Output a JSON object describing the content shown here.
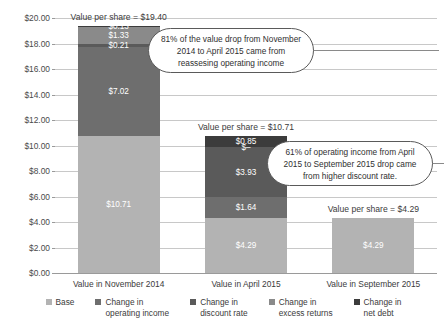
{
  "chart_data": {
    "type": "bar",
    "subtype": "stacked-bar",
    "title": "",
    "xlabel": "",
    "ylabel": "",
    "ylim": [
      0,
      20
    ],
    "ytick_step": 2,
    "grid": true,
    "legend_position": "bottom",
    "currency_prefix": "$",
    "ytick_labels": [
      "$0.00",
      "$2.00",
      "$4.00",
      "$6.00",
      "$8.00",
      "$10.00",
      "$12.00",
      "$14.00",
      "$16.00",
      "$18.00",
      "$20.00"
    ],
    "categories": [
      "Value in November 2014",
      "Value in April 2015",
      "Value in September 2015"
    ],
    "series": [
      {
        "name": "Base",
        "color": "#b3b3b3",
        "values": [
          10.71,
          4.29,
          4.29
        ],
        "labels": [
          "$10.71",
          "$4.29",
          "$4.29"
        ]
      },
      {
        "name": "Change in operating income",
        "color": "#6e6e6e",
        "values": [
          7.02,
          1.64,
          0
        ],
        "labels": [
          "$7.02",
          "$1.64",
          ""
        ]
      },
      {
        "name": "Change in discount rate",
        "color": "#5a5a5a",
        "values": [
          0.21,
          3.93,
          0
        ],
        "labels": [
          "$0.21",
          "$3.93",
          ""
        ]
      },
      {
        "name": "Change in excess returns",
        "color": "#8a8a8a",
        "values": [
          1.33,
          0.0,
          0
        ],
        "labels": [
          "$1.33",
          "$–",
          ""
        ]
      },
      {
        "name": "Change in net debt",
        "color": "#3c3c3c",
        "values": [
          0.13,
          0.85,
          0
        ],
        "labels": [
          "$0.13",
          "$0.85",
          ""
        ]
      }
    ],
    "totals": [
      19.4,
      10.71,
      4.29
    ],
    "total_labels": [
      "Value per share = $19.40",
      "Value per share = $10.71",
      "Value per share = $4.29"
    ],
    "annotations": [
      {
        "id": "callout-operating-income",
        "text": "81% of the value drop from November 2014 to April 2015 came from reassesing operating income"
      },
      {
        "id": "callout-discount-rate",
        "text": "61% of operating income from April 2015 to September 2015 drop came from higher discount rate."
      }
    ]
  },
  "legend": {
    "items": [
      {
        "label": "Base"
      },
      {
        "label": "Change in\noperating income"
      },
      {
        "label": "Change in\ndiscount rate"
      },
      {
        "label": "Change in\nexcess returns"
      },
      {
        "label": "Change in\nnet debt"
      }
    ]
  }
}
